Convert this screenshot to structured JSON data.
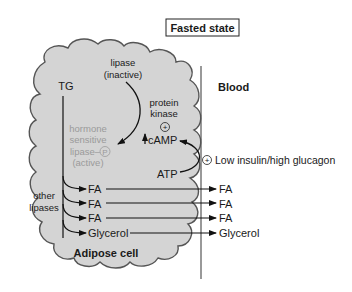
{
  "title": "Fasted state",
  "regions": {
    "cell_label": "Adipose cell",
    "blood_label": "Blood"
  },
  "cell": {
    "tg": "TG",
    "lipase_inactive_line1": "lipase",
    "lipase_inactive_line2": "(inactive)",
    "protein_kinase_line1": "protein",
    "protein_kinase_line2": "kinase",
    "hsl_line1": "hormone",
    "hsl_line2": "sensitive",
    "hsl_line3": "lipase–",
    "hsl_phos": "P",
    "hsl_line4": "(active)",
    "camp": "cAMP",
    "camp_arrow": "↑",
    "atp": "ATP",
    "other_lipases_line1": "other",
    "other_lipases_line2": "lipases",
    "products": [
      "FA",
      "FA",
      "FA",
      "Glycerol"
    ]
  },
  "blood": {
    "signal": "Low insulin/high glucagon",
    "products": [
      "FA",
      "FA",
      "FA",
      "Glycerol"
    ]
  },
  "symbols": {
    "plus": "+"
  },
  "colors": {
    "cell_fill": "#d4d4d4",
    "cell_stroke": "#555555",
    "text": "#1a1a1a",
    "grey_text": "#9a9a9a"
  }
}
